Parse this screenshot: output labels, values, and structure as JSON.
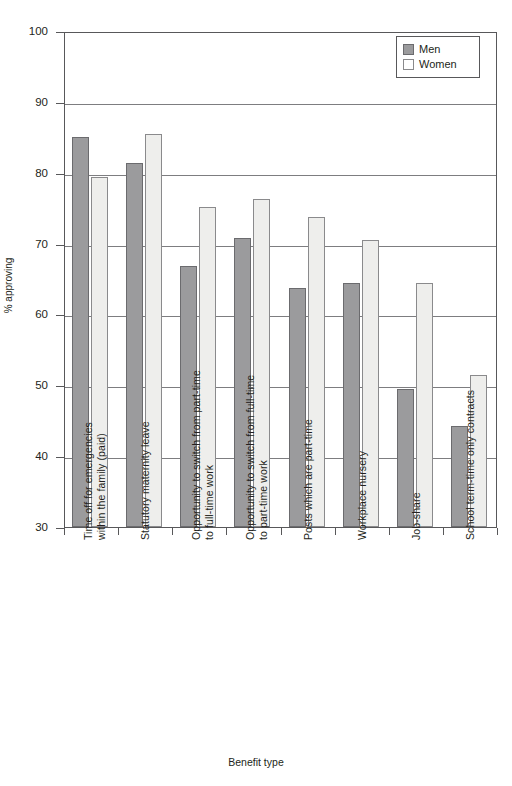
{
  "chart_data": {
    "type": "bar",
    "title": "",
    "xlabel": "Benefit type",
    "ylabel": "% approving",
    "ylim": [
      30,
      100
    ],
    "ytick_values": [
      100,
      90,
      80,
      70,
      60,
      50,
      40,
      30
    ],
    "ytick_labels": [
      "100",
      "90",
      "80",
      "70",
      "60",
      "50",
      "40",
      "30"
    ],
    "grid": "horizontal",
    "legend_position": "top-right",
    "categories": [
      "Time off for emergencies\nwithin the family (paid)",
      "Statutory maternity leave",
      "Opportunity to switch from part-time\nto full-time work",
      "Opportunity to switch from full-time\nto part-time work",
      "Posts which are part-time",
      "Workplace nursery",
      "Job-share",
      "School term-time only contracts"
    ],
    "series": [
      {
        "name": "Men",
        "color": "#9b9b9d",
        "values": [
          85.0,
          81.4,
          66.9,
          70.8,
          63.8,
          64.5,
          49.5,
          44.3
        ]
      },
      {
        "name": "Women",
        "color": "#eeeeec",
        "values": [
          79.4,
          85.5,
          75.1,
          76.3,
          73.8,
          70.5,
          64.4,
          51.4
        ]
      }
    ]
  },
  "legend": {
    "items": [
      {
        "label": "Men",
        "swatch": "men-swatch"
      },
      {
        "label": "Women",
        "swatch": "women-swatch"
      }
    ]
  }
}
